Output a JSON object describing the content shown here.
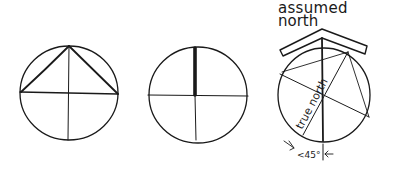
{
  "diagram": {
    "colors": {
      "background": "#ffffff",
      "ink": "#1a1a1a"
    },
    "panels": [
      {
        "id": "circle-triangle",
        "description": "Circle divided into quadrants with an inscribed triangle from the top point to the left and right ends of the horizontal diameter"
      },
      {
        "id": "circle-north-bar",
        "description": "Circle divided into quadrants with a thick bar marking the upper half of the vertical diameter"
      },
      {
        "id": "circle-rotated",
        "description": "Circle with rotated inscribed lines showing true north offset from assumed north"
      }
    ],
    "labels": {
      "assumed_north_line1": "assumed",
      "assumed_north_line2": "north",
      "true_north": "true north",
      "angle": "<45°"
    }
  }
}
